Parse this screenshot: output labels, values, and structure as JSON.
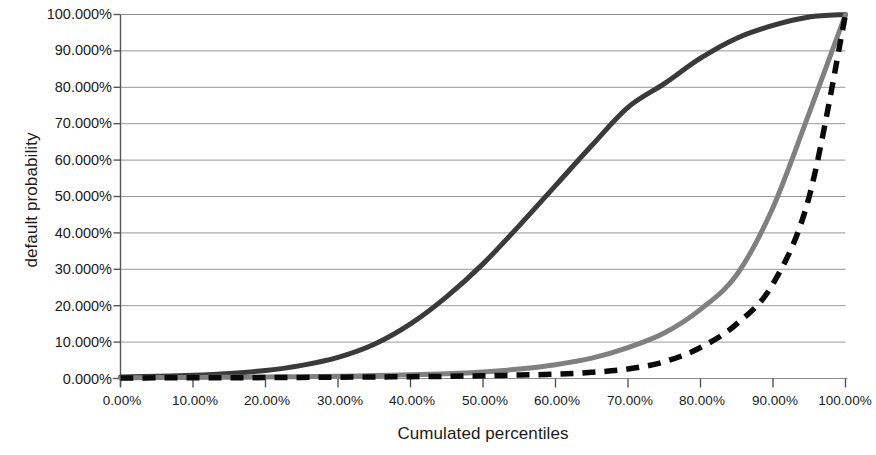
{
  "chart_data": {
    "type": "line",
    "title": "",
    "xlabel": "Cumulated percentiles",
    "ylabel": "default probability",
    "xlim": [
      0,
      100
    ],
    "ylim": [
      0,
      100
    ],
    "grid": true,
    "grid_axis": "y",
    "legend": "none",
    "x_tick_labels": [
      "0.00%",
      "10.00%",
      "20.00%",
      "30.00%",
      "40.00%",
      "50.00%",
      "60.00%",
      "70.00%",
      "80.00%",
      "90.00%",
      "100.00%"
    ],
    "x_ticks": [
      0,
      10,
      20,
      30,
      40,
      50,
      60,
      70,
      80,
      90,
      100
    ],
    "y_tick_labels": [
      "0.000%",
      "10.000%",
      "20.000%",
      "30.000%",
      "40.000%",
      "50.000%",
      "60.000%",
      "70.000%",
      "80.000%",
      "90.000%",
      "100.000%"
    ],
    "y_ticks": [
      0,
      10,
      20,
      30,
      40,
      50,
      60,
      70,
      80,
      90,
      100
    ],
    "x": [
      0,
      5,
      10,
      15,
      20,
      25,
      30,
      35,
      40,
      45,
      50,
      55,
      60,
      65,
      70,
      75,
      80,
      85,
      90,
      95,
      100
    ],
    "series": [
      {
        "name": "curve-dark-solid",
        "style": "solid",
        "color": "#3a3a3a",
        "width": 5,
        "values": [
          0.4,
          0.6,
          0.9,
          1.4,
          2.2,
          3.6,
          5.8,
          9.4,
          15.0,
          22.5,
          31.5,
          42.0,
          53.0,
          64.0,
          74.5,
          81.0,
          88.0,
          93.5,
          97.0,
          99.3,
          100.0
        ]
      },
      {
        "name": "curve-gray-solid",
        "style": "solid",
        "color": "#808080",
        "width": 5,
        "values": [
          0.2,
          0.25,
          0.3,
          0.35,
          0.4,
          0.5,
          0.6,
          0.8,
          1.0,
          1.3,
          1.8,
          2.6,
          3.8,
          5.6,
          8.5,
          12.5,
          19.0,
          28.5,
          47.0,
          73.0,
          100.0
        ]
      },
      {
        "name": "curve-black-dashed",
        "style": "dashed",
        "color": "#0a0a0a",
        "width": 5.5,
        "values": [
          0.15,
          0.18,
          0.2,
          0.22,
          0.25,
          0.3,
          0.35,
          0.42,
          0.5,
          0.6,
          0.75,
          0.95,
          1.2,
          1.7,
          2.6,
          4.6,
          8.5,
          15.0,
          26.0,
          50.0,
          100.0
        ]
      }
    ]
  }
}
